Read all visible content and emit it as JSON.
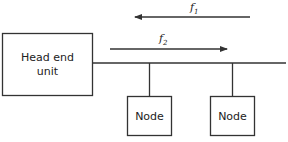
{
  "diagram": {
    "head_end": {
      "line1": "Head end",
      "line2": "unit"
    },
    "nodes": [
      {
        "label": "Node"
      },
      {
        "label": "Node"
      }
    ],
    "arrows": {
      "f1": {
        "letter": "f",
        "subscript": "1",
        "direction": "left"
      },
      "f2": {
        "letter": "f",
        "subscript": "2",
        "direction": "right"
      }
    },
    "colors": {
      "stroke": "#333333",
      "background": "#ffffff"
    }
  }
}
